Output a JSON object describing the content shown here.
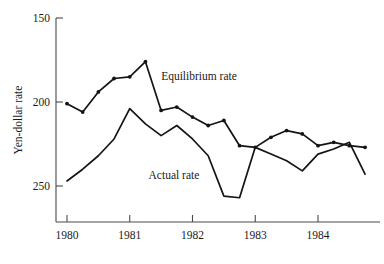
{
  "chart_data": {
    "type": "line",
    "title": "",
    "xlabel": "",
    "ylabel": "Yen-dollar rate",
    "y_axis_inverted": true,
    "ylim": [
      150,
      265
    ],
    "xlim": [
      1980.0,
      1985.0
    ],
    "grid": false,
    "legend_position": "inline-annotation",
    "y_ticks": [
      150,
      200,
      250
    ],
    "y_tick_labels": [
      "150",
      "200",
      "250"
    ],
    "x_ticks": [
      1980,
      1981,
      1982,
      1983,
      1984
    ],
    "x_tick_labels": [
      "1980",
      "1981",
      "1982",
      "1983",
      "1984"
    ],
    "x": [
      1980.0,
      1980.25,
      1980.5,
      1980.75,
      1981.0,
      1981.25,
      1981.5,
      1981.75,
      1982.0,
      1982.25,
      1982.5,
      1982.75,
      1983.0,
      1983.25,
      1983.5,
      1983.75,
      1984.0,
      1984.25,
      1984.5,
      1984.75
    ],
    "series": [
      {
        "name": "Equilibrium rate",
        "markers": true,
        "label_x": 1981.5,
        "label_y": 187,
        "values": [
          201,
          206,
          194,
          186,
          185,
          176,
          205,
          203,
          209,
          214,
          211,
          226,
          227,
          221,
          217,
          219,
          226,
          224,
          226,
          227
        ]
      },
      {
        "name": "Actual rate",
        "markers": false,
        "label_x": 1981.3,
        "label_y": 246,
        "values": [
          247,
          240,
          232,
          222,
          204,
          213,
          220,
          214,
          222,
          232,
          256,
          257,
          227,
          231,
          235,
          241,
          231,
          228,
          224,
          243
        ]
      }
    ]
  }
}
